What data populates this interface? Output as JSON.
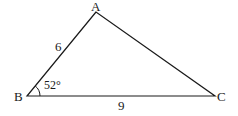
{
  "diagram": {
    "type": "triangle",
    "vertices": {
      "A": {
        "label": "A",
        "x": 96,
        "y": 12
      },
      "B": {
        "label": "B",
        "x": 27,
        "y": 96
      },
      "C": {
        "label": "C",
        "x": 215,
        "y": 96
      }
    },
    "sides": {
      "AB": {
        "label": "6"
      },
      "BC": {
        "label": "9"
      }
    },
    "angles": {
      "B": {
        "label": "52°"
      }
    },
    "stroke_color": "#1a1a1a"
  }
}
